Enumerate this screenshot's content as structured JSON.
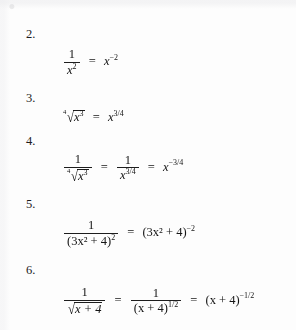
{
  "document": {
    "type": "math-exercise-list",
    "background_color": "#fdfdfd",
    "text_color": "#1a1a1a",
    "items": [
      {
        "number": "2.",
        "expression_plain": "1/x^2 = x^-2",
        "parts": {
          "frac_numerator": "1",
          "frac_denominator_base": "x",
          "frac_denominator_exponent": "2",
          "equals": "=",
          "result_base": "x",
          "result_exponent": "−2"
        }
      },
      {
        "number": "3.",
        "expression_plain": "fourth-root(x^3) = x^(3/4)",
        "parts": {
          "radical_index": "4",
          "radicand_base": "x",
          "radicand_exponent": "3",
          "equals": "=",
          "result_base": "x",
          "result_exponent": "3/4"
        }
      },
      {
        "number": "4.",
        "expression_plain": "1/fourth-root(x^3) = 1/x^(3/4) = x^(-3/4)",
        "parts": {
          "frac1_numerator": "1",
          "radical_index": "4",
          "radicand_base": "x",
          "radicand_exponent": "3",
          "equals1": "=",
          "frac2_numerator": "1",
          "frac2_denominator_base": "x",
          "frac2_denominator_exponent": "3/4",
          "equals2": "=",
          "result_base": "x",
          "result_exponent": "−3/4"
        }
      },
      {
        "number": "5.",
        "expression_plain": "1/(3x^2+4)^2 = (3x^2+4)^-2",
        "parts": {
          "frac_numerator": "1",
          "denominator_group": "(3x² + 4)",
          "denominator_exponent": "2",
          "equals": "=",
          "result_group": "(3x² + 4)",
          "result_exponent": "−2"
        }
      },
      {
        "number": "6.",
        "expression_plain": "1/sqrt(x+4) = 1/(x+4)^(1/2) = (x+4)^(-1/2)",
        "parts": {
          "frac1_numerator": "1",
          "radicand_group": "x + 4",
          "equals1": "=",
          "frac2_numerator": "1",
          "frac2_denominator_group": "(x + 4)",
          "frac2_denominator_exponent": "1/2",
          "equals2": "=",
          "result_group": "(x + 4)",
          "result_exponent": "−1/2"
        }
      }
    ],
    "symbols": {
      "equals": "=",
      "minus": "−",
      "plus": "+",
      "radical": "√",
      "var_x": "x",
      "one": "1",
      "two": "2",
      "three": "3",
      "four": "4"
    }
  }
}
